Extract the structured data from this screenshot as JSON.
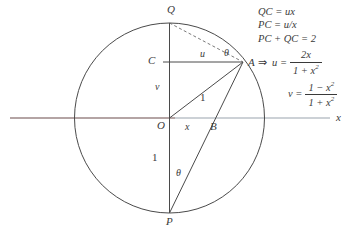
{
  "figure": {
    "colors": {
      "stroke": "#4a4a4a",
      "axis_left": "#6b4a4a",
      "axis_right": "#9aa3ae",
      "text": "#3a3a3a",
      "background": "#ffffff"
    },
    "circle": {
      "center_label": "O",
      "radius_label": "1"
    },
    "points": [
      {
        "name": "Q",
        "label": "Q",
        "x": 170,
        "y": 17
      },
      {
        "name": "C",
        "label": "C",
        "x": 153,
        "y": 62
      },
      {
        "name": "A",
        "label": "A",
        "x": 248,
        "y": 63
      },
      {
        "name": "O",
        "label": "O",
        "x": 156,
        "y": 126
      },
      {
        "name": "B",
        "label": "B",
        "x": 215,
        "y": 128
      },
      {
        "name": "P",
        "label": "P",
        "x": 166,
        "y": 222
      }
    ],
    "segment_labels": [
      {
        "name": "u",
        "label": "u",
        "x": 199,
        "y": 53
      },
      {
        "name": "v",
        "label": "v",
        "x": 155,
        "y": 85
      },
      {
        "name": "radius-oa",
        "label": "1",
        "x": 199,
        "y": 98
      },
      {
        "name": "x",
        "label": "x",
        "x": 186,
        "y": 127
      },
      {
        "name": "op",
        "label": "1",
        "x": 153,
        "y": 157
      }
    ],
    "angle_labels": [
      {
        "name": "theta-at-a",
        "label": "θ",
        "x": 223,
        "y": 52
      },
      {
        "name": "theta-at-p",
        "label": "θ",
        "x": 177,
        "y": 172
      }
    ],
    "axis": {
      "label": "x",
      "label_x": 337,
      "label_y": 118
    }
  },
  "formulas": {
    "line1": "QC = ux",
    "line2": "PC = u/x",
    "line3": "PC + QC = 2",
    "implies": "⇒",
    "u": {
      "lead": "u =",
      "numerator": "2x",
      "denominator_pre": "1 + x",
      "denominator_exp": "2"
    },
    "v": {
      "lead": "v =",
      "numerator_pre": "1 − x",
      "numerator_exp": "2",
      "denominator_pre": "1 + x",
      "denominator_exp": "2"
    }
  }
}
